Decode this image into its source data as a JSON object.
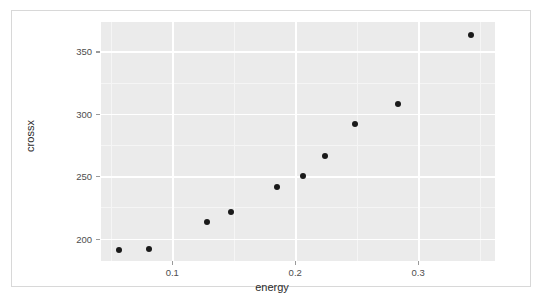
{
  "chart_data": {
    "type": "scatter",
    "title": "",
    "xlabel": "energy",
    "ylabel": "crossx",
    "xlim": [
      0.042,
      0.3625
    ],
    "ylim": [
      182.0,
      373.5
    ],
    "grid": true,
    "legend": null,
    "x": [
      0.057,
      0.081,
      0.128,
      0.148,
      0.185,
      0.206,
      0.224,
      0.249,
      0.284,
      0.343
    ],
    "y": [
      191,
      192,
      213,
      221,
      241,
      250,
      266,
      292,
      308,
      363
    ],
    "points": [
      {
        "x": 0.057,
        "y": 191
      },
      {
        "x": 0.081,
        "y": 192
      },
      {
        "x": 0.128,
        "y": 213
      },
      {
        "x": 0.148,
        "y": 221
      },
      {
        "x": 0.185,
        "y": 241
      },
      {
        "x": 0.206,
        "y": 250
      },
      {
        "x": 0.224,
        "y": 266
      },
      {
        "x": 0.249,
        "y": 292
      },
      {
        "x": 0.284,
        "y": 308
      },
      {
        "x": 0.343,
        "y": 363
      }
    ],
    "x_ticks": [
      {
        "value": 0.1,
        "label": "0.1"
      },
      {
        "value": 0.2,
        "label": "0.2"
      },
      {
        "value": 0.3,
        "label": "0.3"
      }
    ],
    "x_minor_ticks": [
      0.05,
      0.15,
      0.25,
      0.35
    ],
    "y_ticks": [
      {
        "value": 200,
        "label": "200"
      },
      {
        "value": 250,
        "label": "250"
      },
      {
        "value": 300,
        "label": "300"
      },
      {
        "value": 350,
        "label": "350"
      }
    ],
    "y_minor_ticks": [
      225,
      275,
      325
    ],
    "colors": {
      "panel_background": "#ebebeb",
      "major_gridline": "#ffffff",
      "minor_gridline": "#f5f5f5",
      "point": "#1a1a1a",
      "axis_text": "#4d4d4d",
      "axis_title": "#2b2b2b",
      "figure_background": "#ffffff",
      "frame_border": "#d8d8d8"
    }
  }
}
